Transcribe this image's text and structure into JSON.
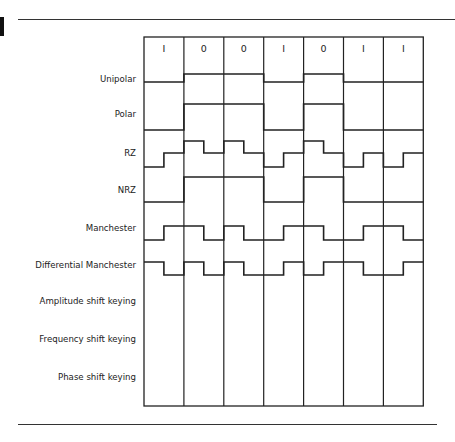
{
  "figure": {
    "bits": [
      "1",
      "0",
      "0",
      "1",
      "0",
      "1",
      "1"
    ],
    "rows": [
      {
        "label": "Unipolar",
        "type": "nrz",
        "levels": [
          "low",
          "high",
          "high",
          "low",
          "high",
          "low",
          "low"
        ]
      },
      {
        "label": "Polar",
        "type": "nrz",
        "levels": [
          "low",
          "high",
          "high",
          "low",
          "high",
          "low",
          "low"
        ]
      },
      {
        "label": "RZ",
        "type": "halves",
        "levels": [
          [
            "low",
            "mid"
          ],
          [
            "high",
            "mid"
          ],
          [
            "high",
            "mid"
          ],
          [
            "low",
            "mid"
          ],
          [
            "high",
            "mid"
          ],
          [
            "low",
            "mid"
          ],
          [
            "low",
            "mid"
          ]
        ]
      },
      {
        "label": "NRZ",
        "type": "nrz",
        "levels": [
          "low",
          "high",
          "high",
          "low",
          "high",
          "low",
          "low"
        ]
      },
      {
        "label": "Manchester",
        "type": "halves",
        "levels": [
          [
            "low",
            "high"
          ],
          [
            "high",
            "low"
          ],
          [
            "high",
            "low"
          ],
          [
            "low",
            "high"
          ],
          [
            "high",
            "low"
          ],
          [
            "low",
            "high"
          ],
          [
            "high",
            "low"
          ]
        ]
      },
      {
        "label": "Differential Manchester",
        "type": "halves",
        "levels": [
          [
            "high",
            "low"
          ],
          [
            "high",
            "low"
          ],
          [
            "high",
            "low"
          ],
          [
            "low",
            "high"
          ],
          [
            "low",
            "high"
          ],
          [
            "high",
            "low"
          ],
          [
            "low",
            "high"
          ]
        ]
      },
      {
        "label": "Amplitude shift keying",
        "type": "empty",
        "levels": []
      },
      {
        "label": "Frequency shift keying",
        "type": "empty",
        "levels": []
      },
      {
        "label": "Phase shift keying",
        "type": "empty",
        "levels": []
      }
    ],
    "line_color": "#222222"
  }
}
